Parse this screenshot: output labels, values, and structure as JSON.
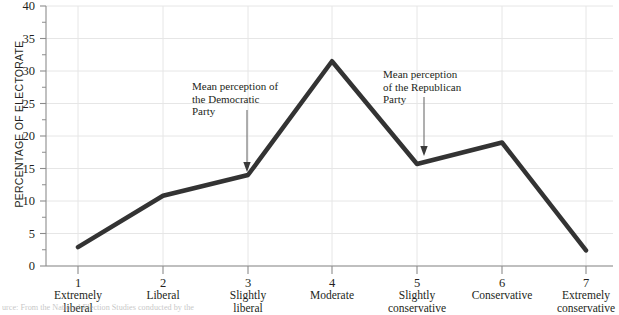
{
  "chart_data": {
    "type": "line",
    "title": "",
    "subtitle": "",
    "xlabel": "",
    "ylabel": "PERCENTAGE OF ELECTORATE",
    "xlim": [
      1,
      7
    ],
    "ylim": [
      0,
      40
    ],
    "ytick_step": 5,
    "grid": true,
    "legend": "none",
    "categories": [
      "1",
      "2",
      "3",
      "4",
      "5",
      "6",
      "7"
    ],
    "category_labels": [
      "Extremely\nliberal",
      "Liberal",
      "Slightly\nliberal",
      "Moderate",
      "Slightly\nconservative",
      "Conservative",
      "Extremely\nconservative"
    ],
    "x": [
      1,
      2,
      3,
      4,
      5,
      6,
      7
    ],
    "values": [
      2.9,
      10.8,
      14.0,
      31.5,
      15.7,
      19.0,
      2.4
    ],
    "ytick_labels": [
      "0",
      "5",
      "10",
      "15",
      "20",
      "25",
      "30",
      "35",
      "40"
    ],
    "series": [
      {
        "name": "Percentage of electorate",
        "values": [
          2.9,
          10.8,
          14.0,
          31.5,
          15.7,
          19.0,
          2.4
        ],
        "color": "#333333",
        "line_width": 4.5
      }
    ],
    "annotations": [
      {
        "id": "democratic",
        "text": "Mean perception of\nthe Democratic\nParty",
        "points_to_x": 3.08,
        "points_to_y": 14.6,
        "arrow": "down"
      },
      {
        "id": "republican",
        "text": "Mean perception\nof the Republican\nParty",
        "points_to_x": 5.07,
        "points_to_y": 16.6,
        "arrow": "down"
      }
    ],
    "colors": {
      "line": "#333333",
      "grid": "#e3e3e3",
      "axis": "#8c8c8c",
      "text": "#231f20",
      "annotation_arrow": "#6d6d6d"
    }
  },
  "caption": {
    "text": "urce: From the National Election Studies conducted by the"
  }
}
